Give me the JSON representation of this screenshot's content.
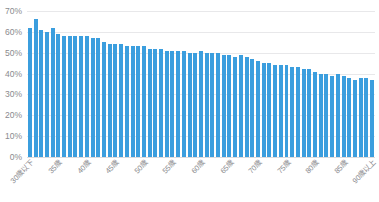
{
  "chart_data": {
    "type": "bar",
    "title": "",
    "xlabel": "",
    "ylabel": "",
    "ylim": [
      0,
      70
    ],
    "ytick_labels": [
      "70%",
      "60%",
      "50%",
      "40%",
      "30%",
      "20%",
      "10%",
      "0%"
    ],
    "ytick_values": [
      70,
      60,
      50,
      40,
      30,
      20,
      10,
      0
    ],
    "grid": true,
    "legend": "none",
    "bar_color": "#3b9ede",
    "grid_color": "#e8e8ea",
    "axis_text_color": "#8a8a8e",
    "categories": [
      "30歳以下",
      "31歳",
      "32歳",
      "33歳",
      "34歳",
      "35歳",
      "36歳",
      "37歳",
      "38歳",
      "39歳",
      "40歳",
      "41歳",
      "42歳",
      "43歳",
      "44歳",
      "45歳",
      "46歳",
      "47歳",
      "48歳",
      "49歳",
      "50歳",
      "51歳",
      "52歳",
      "53歳",
      "54歳",
      "55歳",
      "56歳",
      "57歳",
      "58歳",
      "59歳",
      "60歳",
      "61歳",
      "62歳",
      "63歳",
      "64歳",
      "65歳",
      "66歳",
      "67歳",
      "68歳",
      "69歳",
      "70歳",
      "71歳",
      "72歳",
      "73歳",
      "74歳",
      "75歳",
      "76歳",
      "77歳",
      "78歳",
      "79歳",
      "80歳",
      "81歳",
      "82歳",
      "83歳",
      "84歳",
      "85歳",
      "86歳",
      "87歳",
      "88歳",
      "89歳",
      "90歳以上"
    ],
    "values": [
      62,
      66,
      61,
      60,
      62,
      59,
      58,
      58,
      58,
      58,
      58,
      57,
      57,
      55,
      54,
      54,
      54,
      53,
      53,
      53,
      53,
      52,
      52,
      52,
      51,
      51,
      51,
      51,
      50,
      50,
      51,
      50,
      50,
      50,
      49,
      49,
      48,
      49,
      48,
      47,
      46,
      45,
      45,
      44,
      44,
      44,
      43,
      43,
      42,
      42,
      41,
      40,
      40,
      39,
      40,
      39,
      38,
      37,
      38,
      38,
      37
    ],
    "xtick_labels": [
      "30歳以下",
      "35歳",
      "40歳",
      "45歳",
      "50歳",
      "55歳",
      "60歳",
      "65歳",
      "70歳",
      "75歳",
      "80歳",
      "85歳",
      "90歳以上"
    ],
    "xtick_indices": [
      0,
      5,
      10,
      15,
      20,
      25,
      30,
      35,
      40,
      45,
      50,
      55,
      60
    ]
  }
}
